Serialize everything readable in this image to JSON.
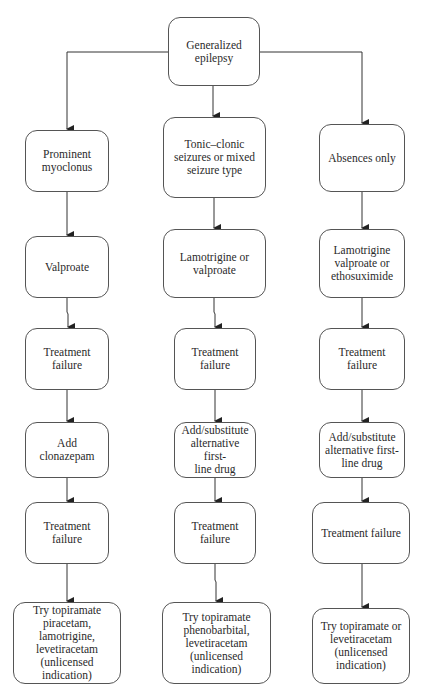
{
  "diagram": {
    "type": "flowchart",
    "root": {
      "id": "root",
      "label": "Generalized\nepilepsy"
    },
    "columns": [
      {
        "id": "col1",
        "nodes": [
          {
            "id": "c1n1",
            "label": "Prominent\nmyoclonus"
          },
          {
            "id": "c1n2",
            "label": "Valproate"
          },
          {
            "id": "c1n3",
            "label": "Treatment\nfailure"
          },
          {
            "id": "c1n4",
            "label": "Add\nclonazepam"
          },
          {
            "id": "c1n5",
            "label": "Treatment\nfailure"
          },
          {
            "id": "c1n6",
            "label": "Try topiramate\npiracetam,\nlamotrigine,\nlevetiracetam\n(unlicensed\nindication)"
          }
        ]
      },
      {
        "id": "col2",
        "nodes": [
          {
            "id": "c2n1",
            "label": "Tonic–clonic\nseizures or mixed\nseizure type"
          },
          {
            "id": "c2n2",
            "label": "Lamotrigine or\nvalproate"
          },
          {
            "id": "c2n3",
            "label": "Treatment\nfailure"
          },
          {
            "id": "c2n4",
            "label": "Add/substitute\nalternative first-\nline drug"
          },
          {
            "id": "c2n5",
            "label": "Treatment\nfailure"
          },
          {
            "id": "c2n6",
            "label": "Try topiramate\nphenobarbital,\nlevetiracetam\n(unlicensed\nindication)"
          }
        ]
      },
      {
        "id": "col3",
        "nodes": [
          {
            "id": "c3n1",
            "label": "Absences only"
          },
          {
            "id": "c3n2",
            "label": "Lamotrigine\nvalproate or\nethosuximide"
          },
          {
            "id": "c3n3",
            "label": "Treatment\nfailure"
          },
          {
            "id": "c3n4",
            "label": "Add/substitute\nalternative first-\nline drug"
          },
          {
            "id": "c3n5",
            "label": "Treatment failure"
          },
          {
            "id": "c3n6",
            "label": "Try topiramate or\nlevetiracetam\n(unlicensed\nindication)"
          }
        ]
      }
    ],
    "edges": [
      [
        "root",
        "c1n1"
      ],
      [
        "root",
        "c2n1"
      ],
      [
        "root",
        "c3n1"
      ],
      [
        "c1n1",
        "c1n2"
      ],
      [
        "c1n2",
        "c1n3"
      ],
      [
        "c1n3",
        "c1n4"
      ],
      [
        "c1n4",
        "c1n5"
      ],
      [
        "c1n5",
        "c1n6"
      ],
      [
        "c2n1",
        "c2n2"
      ],
      [
        "c2n2",
        "c2n3"
      ],
      [
        "c2n3",
        "c2n4"
      ],
      [
        "c2n4",
        "c2n5"
      ],
      [
        "c2n5",
        "c2n6"
      ],
      [
        "c3n1",
        "c3n2"
      ],
      [
        "c3n2",
        "c3n3"
      ],
      [
        "c3n3",
        "c3n4"
      ],
      [
        "c3n4",
        "c3n5"
      ],
      [
        "c3n5",
        "c3n6"
      ]
    ],
    "colors": {
      "line": "#333333",
      "border": "#555555",
      "text": "#2a2a2a",
      "background": "#ffffff"
    }
  }
}
